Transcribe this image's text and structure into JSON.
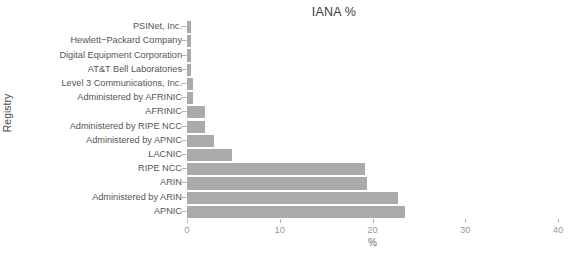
{
  "chart_data": {
    "type": "bar",
    "orientation": "horizontal",
    "title": "IANA %",
    "xlabel": "%",
    "ylabel": "Registry",
    "xlim": [
      0,
      40
    ],
    "xticks": [
      0,
      10,
      20,
      30,
      40
    ],
    "xtick_labels": [
      "0",
      "10",
      "20",
      "30",
      "40"
    ],
    "grid": false,
    "legend": false,
    "bar_color": "#aaaaaa",
    "background": "#ffffff",
    "tick_dash": "–",
    "categories": [
      "PSINet, Inc.",
      "Hewlett−Packard Company",
      "Digital Equipment Corporation",
      "AT&T Bell Laboratories",
      "Level 3 Communications, Inc.",
      "Administered by AFRINIC",
      "AFRINIC",
      "Administered by RIPE NCC",
      "Administered by APNIC",
      "LACNIC",
      "RIPE NCC",
      "ARIN",
      "Administered by ARIN",
      "APNIC"
    ],
    "values": [
      0.4,
      0.4,
      0.4,
      0.4,
      0.7,
      0.7,
      1.9,
      1.9,
      2.9,
      4.8,
      19.2,
      19.4,
      22.8,
      23.5
    ]
  }
}
